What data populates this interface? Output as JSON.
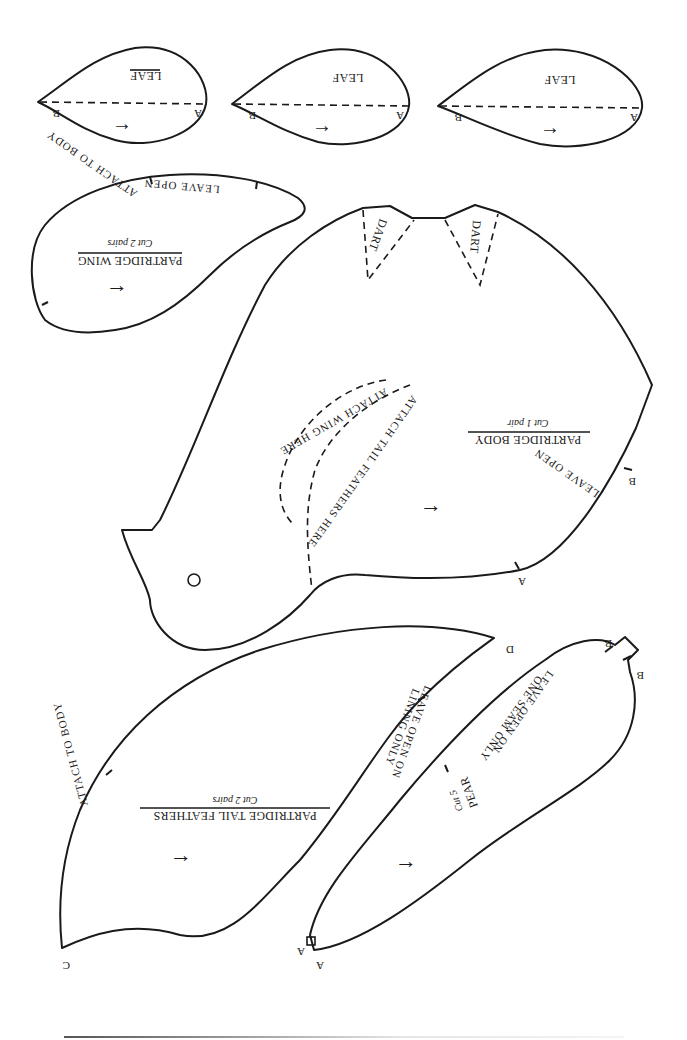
{
  "sheet": {
    "orientation": "rotated 180 degrees",
    "ink_color": "#1a1a1a",
    "paper_color": "#ffffff"
  },
  "pieces": {
    "leaves": [
      {
        "title": "LEAF",
        "point_a": "A",
        "point_b": "B",
        "grain_arrow": "→"
      },
      {
        "title": "LEAF",
        "point_a": "A",
        "point_b": "B",
        "grain_arrow": "→"
      },
      {
        "title": "LEAF",
        "point_a": "A",
        "point_b": "B",
        "grain_arrow": "→"
      }
    ],
    "wing": {
      "title": "PARTRIDGE WING",
      "cut": "Cut 2 pairs",
      "edge_label_1": "LEAVE OPEN",
      "edge_label_2": "ATTACH TO BODY",
      "grain_arrow": "→"
    },
    "body": {
      "title": "PARTRIDGE BODY",
      "cut": "Cut 1 pair",
      "dart_1": "DART",
      "dart_2": "DART",
      "wing_guide": "ATTACH WING HERE",
      "tail_guide": "ATTACH TAIL FEATHERS HERE",
      "opening": "LEAVE OPEN",
      "point_a": "A",
      "point_b": "B",
      "grain_arrow": "→"
    },
    "tail": {
      "title": "PARTRIDGE TAIL FEATHERS",
      "cut": "Cut 2 pairs",
      "edge_label": "ATTACH TO BODY",
      "opening_line_1": "LEAVE OPEN ON",
      "opening_line_2": "LINING ONLY",
      "point_c": "C",
      "point_d": "D",
      "grain_arrow": "→"
    },
    "pear": {
      "title": "PEAR",
      "cut": "Cut 5",
      "opening_line_1": "LEAVE OPEN ON",
      "opening_line_2": "ONE SEAM ONLY",
      "point_a1": "A",
      "point_a2": "A",
      "point_b1": "B",
      "point_b2": "B",
      "grain_arrow": "→"
    }
  }
}
